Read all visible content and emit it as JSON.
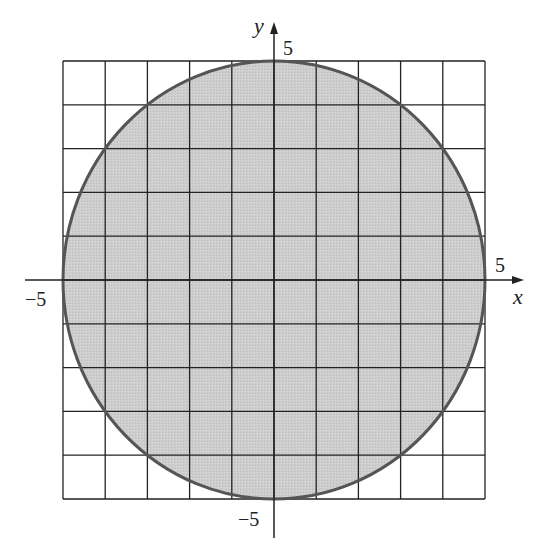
{
  "diagram": {
    "type": "disk-on-grid",
    "grid": {
      "xmin": -5,
      "xmax": 5,
      "ymin": -5,
      "ymax": 5,
      "step": 1
    },
    "circle": {
      "cx": 0,
      "cy": 0,
      "r": 5
    },
    "colors": {
      "fill": "#cfcfcf",
      "stroke": "#555555",
      "grid": "#222222",
      "axis": "#222222"
    },
    "axes": {
      "x_label": "x",
      "y_label": "y",
      "x_pos_tick": "5",
      "x_neg_tick": "−5",
      "y_pos_tick": "5",
      "y_neg_tick": "−5"
    }
  }
}
